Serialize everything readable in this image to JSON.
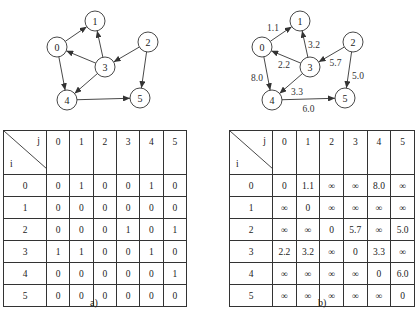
{
  "graph_a": {
    "nodes": [
      {
        "id": "0",
        "x": 57,
        "y": 47
      },
      {
        "id": "1",
        "x": 95,
        "y": 21
      },
      {
        "id": "2",
        "x": 148,
        "y": 42
      },
      {
        "id": "3",
        "x": 105,
        "y": 67
      },
      {
        "id": "4",
        "x": 67,
        "y": 100
      },
      {
        "id": "5",
        "x": 140,
        "y": 98
      }
    ],
    "edges": [
      {
        "from": "0",
        "to": "1"
      },
      {
        "from": "0",
        "to": "4"
      },
      {
        "from": "3",
        "to": "0"
      },
      {
        "from": "3",
        "to": "1"
      },
      {
        "from": "3",
        "to": "4"
      },
      {
        "from": "2",
        "to": "3"
      },
      {
        "from": "2",
        "to": "5"
      },
      {
        "from": "4",
        "to": "5"
      }
    ]
  },
  "graph_b": {
    "edges": [
      {
        "from": "0",
        "to": "1",
        "weight": "1.1"
      },
      {
        "from": "0",
        "to": "4",
        "weight": "8.0"
      },
      {
        "from": "3",
        "to": "0",
        "weight": "2.2"
      },
      {
        "from": "3",
        "to": "1",
        "weight": "3.2"
      },
      {
        "from": "3",
        "to": "4",
        "weight": "3.3"
      },
      {
        "from": "2",
        "to": "3",
        "weight": "5.7"
      },
      {
        "from": "2",
        "to": "5",
        "weight": "5.0"
      },
      {
        "from": "4",
        "to": "5",
        "weight": "6.0"
      }
    ]
  },
  "table_a": {
    "row_axis": "i",
    "col_axis": "j",
    "columns": [
      "0",
      "1",
      "2",
      "3",
      "4",
      "5"
    ],
    "rows": [
      {
        "label": "0",
        "cells": [
          "0",
          "1",
          "0",
          "0",
          "1",
          "0"
        ]
      },
      {
        "label": "1",
        "cells": [
          "0",
          "0",
          "0",
          "0",
          "0",
          "0"
        ]
      },
      {
        "label": "2",
        "cells": [
          "0",
          "0",
          "0",
          "1",
          "0",
          "1"
        ]
      },
      {
        "label": "3",
        "cells": [
          "1",
          "1",
          "0",
          "0",
          "1",
          "0"
        ]
      },
      {
        "label": "4",
        "cells": [
          "0",
          "0",
          "0",
          "0",
          "0",
          "1"
        ]
      },
      {
        "label": "5",
        "cells": [
          "0",
          "0",
          "0",
          "0",
          "0",
          "0"
        ]
      }
    ],
    "caption": "a)"
  },
  "table_b": {
    "row_axis": "i",
    "col_axis": "j",
    "columns": [
      "0",
      "1",
      "2",
      "3",
      "4",
      "5"
    ],
    "rows": [
      {
        "label": "0",
        "cells": [
          "0",
          "1.1",
          "∞",
          "∞",
          "8.0",
          "∞"
        ]
      },
      {
        "label": "1",
        "cells": [
          "∞",
          "0",
          "∞",
          "∞",
          "∞",
          "∞"
        ]
      },
      {
        "label": "2",
        "cells": [
          "∞",
          "∞",
          "0",
          "5.7",
          "∞",
          "5.0"
        ]
      },
      {
        "label": "3",
        "cells": [
          "2.2",
          "3.2",
          "∞",
          "0",
          "3.3",
          "∞"
        ]
      },
      {
        "label": "4",
        "cells": [
          "∞",
          "∞",
          "∞",
          "∞",
          "0",
          "6.0"
        ]
      },
      {
        "label": "5",
        "cells": [
          "∞",
          "∞",
          "∞",
          "∞",
          "∞",
          "0"
        ]
      }
    ],
    "caption": "b)"
  }
}
